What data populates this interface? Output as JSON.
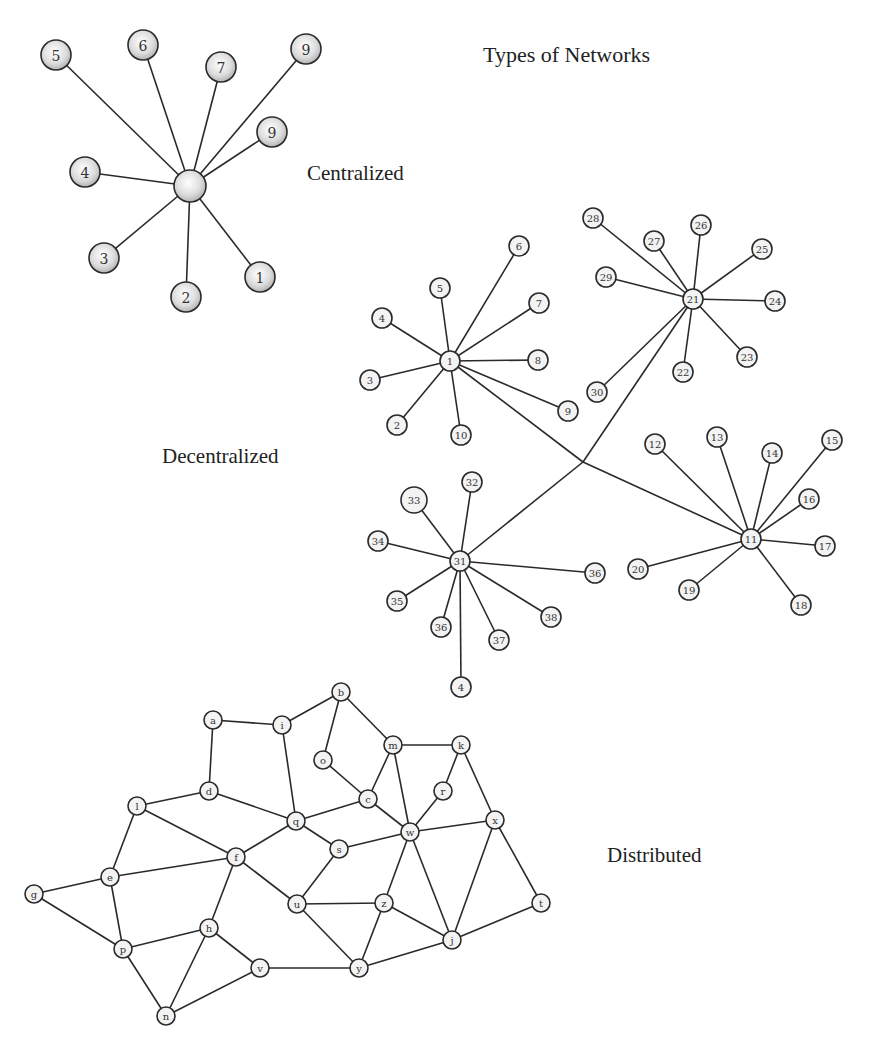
{
  "title": "Types of Networks",
  "colors": {
    "edge": "#2a2a2a",
    "node_fill_plain": "#f3f3f3",
    "node_shade_light": "#ffffff",
    "node_shade_dark": "#b8b8b8",
    "text": "#222222"
  },
  "labels": {
    "title": {
      "text": "Types of Networks",
      "x": 483,
      "y": 62,
      "size": 22
    },
    "centralized": {
      "text": "Centralized",
      "x": 307,
      "y": 180,
      "size": 21
    },
    "decentralized": {
      "text": "Decentralized",
      "x": 162,
      "y": 463,
      "size": 21
    },
    "distributed": {
      "text": "Distributed",
      "x": 607,
      "y": 862,
      "size": 21
    }
  },
  "networks": [
    {
      "name": "Centralized",
      "style": "shaded",
      "radius": 15,
      "font_size": 14,
      "nodes": [
        {
          "id": "hub",
          "label": "",
          "x": 190,
          "y": 186,
          "r": 16
        },
        {
          "id": "c5",
          "label": "5",
          "x": 56,
          "y": 55
        },
        {
          "id": "c6",
          "label": "6",
          "x": 143,
          "y": 45
        },
        {
          "id": "c7",
          "label": "7",
          "x": 221,
          "y": 67
        },
        {
          "id": "c9a",
          "label": "9",
          "x": 306,
          "y": 49
        },
        {
          "id": "c9b",
          "label": "9",
          "x": 272,
          "y": 132
        },
        {
          "id": "c4",
          "label": "4",
          "x": 85,
          "y": 172
        },
        {
          "id": "c3",
          "label": "3",
          "x": 104,
          "y": 258
        },
        {
          "id": "c2",
          "label": "2",
          "x": 186,
          "y": 297
        },
        {
          "id": "c1",
          "label": "1",
          "x": 260,
          "y": 277
        }
      ],
      "edges": [
        [
          "hub",
          "c5"
        ],
        [
          "hub",
          "c6"
        ],
        [
          "hub",
          "c7"
        ],
        [
          "hub",
          "c9a"
        ],
        [
          "hub",
          "c9b"
        ],
        [
          "hub",
          "c4"
        ],
        [
          "hub",
          "c3"
        ],
        [
          "hub",
          "c2"
        ],
        [
          "hub",
          "c1"
        ]
      ]
    },
    {
      "name": "Decentralized",
      "style": "plain",
      "radius": 10,
      "font_size": 10,
      "nodes": [
        {
          "id": "d1",
          "label": "1",
          "x": 450,
          "y": 361
        },
        {
          "id": "d2",
          "label": "2",
          "x": 397,
          "y": 425
        },
        {
          "id": "d3",
          "label": "3",
          "x": 370,
          "y": 380
        },
        {
          "id": "d4",
          "label": "4",
          "x": 382,
          "y": 318
        },
        {
          "id": "d5",
          "label": "5",
          "x": 440,
          "y": 288
        },
        {
          "id": "d6",
          "label": "6",
          "x": 519,
          "y": 246
        },
        {
          "id": "d7",
          "label": "7",
          "x": 539,
          "y": 303
        },
        {
          "id": "d8",
          "label": "8",
          "x": 538,
          "y": 360
        },
        {
          "id": "d9",
          "label": "9",
          "x": 568,
          "y": 411
        },
        {
          "id": "d10",
          "label": "10",
          "x": 461,
          "y": 435
        },
        {
          "id": "d21",
          "label": "21",
          "x": 693,
          "y": 299
        },
        {
          "id": "d22",
          "label": "22",
          "x": 683,
          "y": 372
        },
        {
          "id": "d23",
          "label": "23",
          "x": 747,
          "y": 357
        },
        {
          "id": "d24",
          "label": "24",
          "x": 775,
          "y": 301
        },
        {
          "id": "d25",
          "label": "25",
          "x": 762,
          "y": 249
        },
        {
          "id": "d26",
          "label": "26",
          "x": 701,
          "y": 225
        },
        {
          "id": "d27",
          "label": "27",
          "x": 654,
          "y": 241
        },
        {
          "id": "d28",
          "label": "28",
          "x": 593,
          "y": 218
        },
        {
          "id": "d29",
          "label": "29",
          "x": 606,
          "y": 277
        },
        {
          "id": "d30",
          "label": "30",
          "x": 597,
          "y": 392
        },
        {
          "id": "d11",
          "label": "11",
          "x": 751,
          "y": 539
        },
        {
          "id": "d12",
          "label": "12",
          "x": 655,
          "y": 444
        },
        {
          "id": "d13",
          "label": "13",
          "x": 717,
          "y": 437
        },
        {
          "id": "d14",
          "label": "14",
          "x": 772,
          "y": 453
        },
        {
          "id": "d15",
          "label": "15",
          "x": 832,
          "y": 440
        },
        {
          "id": "d16",
          "label": "16",
          "x": 809,
          "y": 499
        },
        {
          "id": "d17",
          "label": "17",
          "x": 825,
          "y": 546
        },
        {
          "id": "d18",
          "label": "18",
          "x": 801,
          "y": 605
        },
        {
          "id": "d19",
          "label": "19",
          "x": 689,
          "y": 590
        },
        {
          "id": "d20",
          "label": "20",
          "x": 638,
          "y": 569
        },
        {
          "id": "d31",
          "label": "31",
          "x": 460,
          "y": 561
        },
        {
          "id": "d32",
          "label": "32",
          "x": 472,
          "y": 482
        },
        {
          "id": "d33",
          "label": "33",
          "x": 414,
          "y": 500,
          "r": 13
        },
        {
          "id": "d34",
          "label": "34",
          "x": 378,
          "y": 541
        },
        {
          "id": "d35",
          "label": "35",
          "x": 397,
          "y": 601
        },
        {
          "id": "d36a",
          "label": "36",
          "x": 441,
          "y": 627
        },
        {
          "id": "d37",
          "label": "37",
          "x": 499,
          "y": 640
        },
        {
          "id": "d38",
          "label": "38",
          "x": 551,
          "y": 617
        },
        {
          "id": "d36b",
          "label": "36",
          "x": 595,
          "y": 573
        },
        {
          "id": "d4b",
          "label": "4",
          "x": 461,
          "y": 687
        },
        {
          "id": "junction",
          "label": "",
          "x": 583,
          "y": 462,
          "r": 0
        }
      ],
      "edges": [
        [
          "d1",
          "d2"
        ],
        [
          "d1",
          "d3"
        ],
        [
          "d1",
          "d4"
        ],
        [
          "d1",
          "d5"
        ],
        [
          "d1",
          "d6"
        ],
        [
          "d1",
          "d7"
        ],
        [
          "d1",
          "d8"
        ],
        [
          "d1",
          "d9"
        ],
        [
          "d1",
          "d10"
        ],
        [
          "d21",
          "d22"
        ],
        [
          "d21",
          "d23"
        ],
        [
          "d21",
          "d24"
        ],
        [
          "d21",
          "d25"
        ],
        [
          "d21",
          "d26"
        ],
        [
          "d21",
          "d27"
        ],
        [
          "d21",
          "d28"
        ],
        [
          "d21",
          "d29"
        ],
        [
          "d21",
          "d30"
        ],
        [
          "d11",
          "d12"
        ],
        [
          "d11",
          "d13"
        ],
        [
          "d11",
          "d14"
        ],
        [
          "d11",
          "d15"
        ],
        [
          "d11",
          "d16"
        ],
        [
          "d11",
          "d17"
        ],
        [
          "d11",
          "d18"
        ],
        [
          "d11",
          "d19"
        ],
        [
          "d11",
          "d20"
        ],
        [
          "d31",
          "d32"
        ],
        [
          "d31",
          "d33"
        ],
        [
          "d31",
          "d34"
        ],
        [
          "d31",
          "d35"
        ],
        [
          "d31",
          "d36a"
        ],
        [
          "d31",
          "d37"
        ],
        [
          "d31",
          "d38"
        ],
        [
          "d31",
          "d36b"
        ],
        [
          "d31",
          "d4b"
        ],
        [
          "d1",
          "junction"
        ],
        [
          "junction",
          "d11"
        ],
        [
          "d21",
          "junction"
        ],
        [
          "junction",
          "d31"
        ]
      ]
    },
    {
      "name": "Distributed",
      "style": "plain",
      "radius": 9,
      "font_size": 10,
      "nodes": [
        {
          "id": "a",
          "label": "a",
          "x": 213,
          "y": 720
        },
        {
          "id": "b",
          "label": "b",
          "x": 341,
          "y": 692
        },
        {
          "id": "c",
          "label": "c",
          "x": 368,
          "y": 799
        },
        {
          "id": "d",
          "label": "d",
          "x": 209,
          "y": 791
        },
        {
          "id": "e",
          "label": "e",
          "x": 110,
          "y": 877
        },
        {
          "id": "f",
          "label": "f",
          "x": 236,
          "y": 857
        },
        {
          "id": "g",
          "label": "g",
          "x": 34,
          "y": 894
        },
        {
          "id": "h",
          "label": "h",
          "x": 209,
          "y": 928
        },
        {
          "id": "i",
          "label": "i",
          "x": 282,
          "y": 725
        },
        {
          "id": "j",
          "label": "j",
          "x": 452,
          "y": 940
        },
        {
          "id": "k",
          "label": "k",
          "x": 461,
          "y": 745
        },
        {
          "id": "l",
          "label": "l",
          "x": 137,
          "y": 806
        },
        {
          "id": "m",
          "label": "m",
          "x": 393,
          "y": 745
        },
        {
          "id": "n",
          "label": "n",
          "x": 166,
          "y": 1016
        },
        {
          "id": "o",
          "label": "o",
          "x": 323,
          "y": 760
        },
        {
          "id": "p",
          "label": "p",
          "x": 123,
          "y": 949
        },
        {
          "id": "q",
          "label": "q",
          "x": 296,
          "y": 821
        },
        {
          "id": "r",
          "label": "r",
          "x": 443,
          "y": 791
        },
        {
          "id": "s",
          "label": "s",
          "x": 339,
          "y": 849
        },
        {
          "id": "t",
          "label": "t",
          "x": 541,
          "y": 903
        },
        {
          "id": "u",
          "label": "u",
          "x": 297,
          "y": 904
        },
        {
          "id": "v",
          "label": "v",
          "x": 260,
          "y": 968
        },
        {
          "id": "w",
          "label": "w",
          "x": 410,
          "y": 832
        },
        {
          "id": "x",
          "label": "x",
          "x": 495,
          "y": 820
        },
        {
          "id": "y",
          "label": "y",
          "x": 359,
          "y": 968
        },
        {
          "id": "z",
          "label": "z",
          "x": 384,
          "y": 903
        }
      ],
      "edges": [
        [
          "a",
          "i"
        ],
        [
          "a",
          "d"
        ],
        [
          "i",
          "b"
        ],
        [
          "i",
          "q"
        ],
        [
          "b",
          "o"
        ],
        [
          "b",
          "m"
        ],
        [
          "o",
          "c"
        ],
        [
          "m",
          "c"
        ],
        [
          "m",
          "k"
        ],
        [
          "m",
          "w"
        ],
        [
          "k",
          "r"
        ],
        [
          "k",
          "x"
        ],
        [
          "r",
          "w"
        ],
        [
          "c",
          "w"
        ],
        [
          "c",
          "q"
        ],
        [
          "d",
          "l"
        ],
        [
          "d",
          "q"
        ],
        [
          "q",
          "f"
        ],
        [
          "q",
          "s"
        ],
        [
          "s",
          "w"
        ],
        [
          "s",
          "u"
        ],
        [
          "w",
          "x"
        ],
        [
          "w",
          "z"
        ],
        [
          "w",
          "j"
        ],
        [
          "x",
          "j"
        ],
        [
          "x",
          "t"
        ],
        [
          "t",
          "j"
        ],
        [
          "l",
          "f"
        ],
        [
          "l",
          "e"
        ],
        [
          "e",
          "f"
        ],
        [
          "e",
          "g"
        ],
        [
          "e",
          "p"
        ],
        [
          "g",
          "p"
        ],
        [
          "f",
          "h"
        ],
        [
          "f",
          "u"
        ],
        [
          "p",
          "h"
        ],
        [
          "p",
          "n"
        ],
        [
          "h",
          "n"
        ],
        [
          "h",
          "v"
        ],
        [
          "n",
          "v"
        ],
        [
          "v",
          "y"
        ],
        [
          "u",
          "z"
        ],
        [
          "u",
          "y"
        ],
        [
          "z",
          "y"
        ],
        [
          "z",
          "j"
        ],
        [
          "y",
          "j"
        ]
      ]
    }
  ]
}
